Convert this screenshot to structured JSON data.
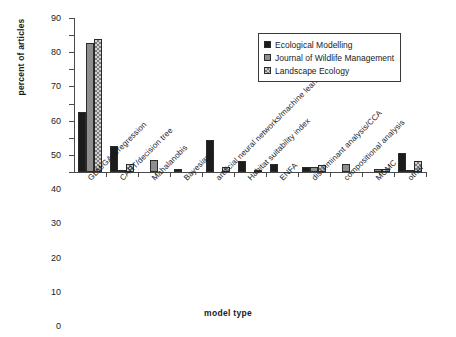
{
  "chart_data": {
    "type": "bar",
    "title": "",
    "xlabel": "model type",
    "ylabel": "percent of articles",
    "ylim": [
      0,
      90
    ],
    "ytick_step": 10,
    "yticks": [
      0,
      10,
      20,
      30,
      40,
      50,
      60,
      70,
      80,
      90
    ],
    "grid": false,
    "legend_position": "upper right",
    "categories": [
      "GLM/GAM/regression",
      "CART/decision tree",
      "Mahalanobis",
      "Bayesian",
      "artificial neural networks/machine learning",
      "Habitat suitability index",
      "ENFA",
      "discriminant analysis/CCA",
      "compositional analysis",
      "MCMC",
      "other"
    ],
    "series": [
      {
        "name": "Ecological Modelling",
        "color": "#1c1c1c",
        "values": [
          34.8,
          15.3,
          0,
          1.7,
          18.5,
          6.5,
          4.7,
          3.0,
          0,
          0,
          11.0
        ]
      },
      {
        "name": "Journal of Wildlife Management",
        "color": "#8e8e8e",
        "values": [
          75.2,
          1.2,
          7.3,
          0,
          0,
          0,
          0,
          3.0,
          4.8,
          1.5,
          0.8
        ]
      },
      {
        "name": "Landscape Ecology",
        "color": "#d2d2d2",
        "values": [
          77.8,
          4.8,
          0,
          0,
          3.2,
          1.3,
          0,
          4.3,
          0,
          1.5,
          6.2
        ]
      }
    ]
  },
  "legend": {
    "items": [
      {
        "label": "Ecological Modelling"
      },
      {
        "label": "Journal of Wildlife Management"
      },
      {
        "label": "Landscape Ecology"
      }
    ]
  },
  "caption": {
    "text": ""
  }
}
